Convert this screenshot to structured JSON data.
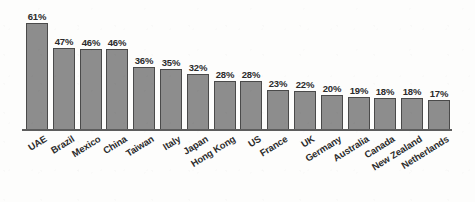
{
  "chart_data": {
    "type": "bar",
    "title": "",
    "subtitle": "",
    "xlabel": "",
    "ylabel": "",
    "ylim": [
      0,
      61
    ],
    "grid": false,
    "legend": false,
    "orientation": "vertical",
    "value_label_suffix": "%",
    "categories": [
      "UAE",
      "Brazil",
      "Mexico",
      "China",
      "Taiwan",
      "Italy",
      "Japan",
      "Hong Kong",
      "US",
      "France",
      "UK",
      "Germany",
      "Australia",
      "Canada",
      "New Zealand",
      "Netherlands"
    ],
    "values": [
      61,
      47,
      46,
      46,
      36,
      35,
      32,
      28,
      28,
      23,
      22,
      20,
      19,
      18,
      18,
      17
    ],
    "value_labels": [
      "61%",
      "47%",
      "46%",
      "46%",
      "36%",
      "35%",
      "32%",
      "28%",
      "28%",
      "23%",
      "22%",
      "20%",
      "19%",
      "18%",
      "18%",
      "17%"
    ],
    "bars": [
      {
        "category": "UAE",
        "value": 61,
        "label": "61%"
      },
      {
        "category": "Brazil",
        "value": 47,
        "label": "47%"
      },
      {
        "category": "Mexico",
        "value": 46,
        "label": "46%"
      },
      {
        "category": "China",
        "value": 46,
        "label": "46%"
      },
      {
        "category": "Taiwan",
        "value": 36,
        "label": "36%"
      },
      {
        "category": "Italy",
        "value": 35,
        "label": "35%"
      },
      {
        "category": "Japan",
        "value": 32,
        "label": "32%"
      },
      {
        "category": "Hong Kong",
        "value": 28,
        "label": "28%"
      },
      {
        "category": "US",
        "value": 28,
        "label": "28%"
      },
      {
        "category": "France",
        "value": 23,
        "label": "23%"
      },
      {
        "category": "UK",
        "value": 22,
        "label": "22%"
      },
      {
        "category": "Germany",
        "value": 20,
        "label": "20%"
      },
      {
        "category": "Australia",
        "value": 19,
        "label": "19%"
      },
      {
        "category": "Canada",
        "value": 18,
        "label": "18%"
      },
      {
        "category": "New Zealand",
        "value": 18,
        "label": "18%"
      },
      {
        "category": "Netherlands",
        "value": 17,
        "label": "17%"
      }
    ],
    "colors": {
      "bar_fill": "#8d8d8d",
      "bar_border": "#4a4a4a",
      "axis_line": "#5d5d5d",
      "text": "#2b2b2b",
      "background": "#fdfdfc"
    }
  }
}
